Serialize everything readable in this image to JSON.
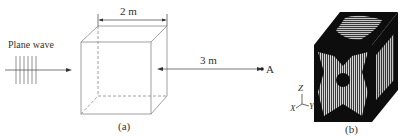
{
  "panel_a": {
    "wave_label": "Plane wave",
    "width_label": "2 m",
    "distance_label": "3 m",
    "point_label": "A",
    "caption": "(a)"
  },
  "panel_b": {
    "axes": {
      "z": "Z",
      "x": "X",
      "y": "Y"
    },
    "caption": "(b)"
  }
}
